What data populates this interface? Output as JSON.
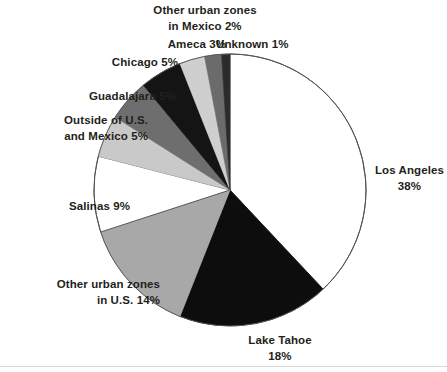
{
  "chart_data": {
    "type": "pie",
    "title": "",
    "subtitle": "",
    "xlabel": "",
    "ylabel": "",
    "legend_position": "none",
    "grid": false,
    "units": "percent",
    "start_angle_deg": 0,
    "direction": "clockwise",
    "categories": [
      "Los Angeles",
      "Lake Tahoe",
      "Other urban zones in U.S.",
      "Salinas",
      "Outside of U.S. and Mexico",
      "Guadalajara",
      "Chicago",
      "Ameca",
      "Other urban zones in Mexico",
      "Unknown"
    ],
    "values": [
      38,
      18,
      14,
      9,
      5,
      5,
      5,
      3,
      2,
      1
    ],
    "colors": [
      "#ffffff",
      "#0d0d0d",
      "#a8a8a8",
      "#ffffff",
      "#c9c9c9",
      "#6e6e6e",
      "#141414",
      "#cfcfcf",
      "#6b6b6b",
      "#2b2b2b"
    ],
    "slices": [
      {
        "name": "Los Angeles",
        "value": 38,
        "color": "#ffffff"
      },
      {
        "name": "Lake Tahoe",
        "value": 18,
        "color": "#0d0d0d"
      },
      {
        "name": "Other urban zones in U.S.",
        "value": 14,
        "color": "#a8a8a8"
      },
      {
        "name": "Salinas",
        "value": 9,
        "color": "#ffffff"
      },
      {
        "name": "Outside of U.S. and Mexico",
        "value": 5,
        "color": "#c9c9c9"
      },
      {
        "name": "Guadalajara",
        "value": 5,
        "color": "#6e6e6e"
      },
      {
        "name": "Chicago",
        "value": 5,
        "color": "#141414"
      },
      {
        "name": "Ameca",
        "value": 3,
        "color": "#cfcfcf"
      },
      {
        "name": "Other urban zones in Mexico",
        "value": 2,
        "color": "#6b6b6b"
      },
      {
        "name": "Unknown",
        "value": 1,
        "color": "#2b2b2b"
      }
    ]
  },
  "labels": {
    "mexico_other_line1": "Other urban zones",
    "mexico_other_line2": "in Mexico 2%",
    "ameca": "Ameca 3%",
    "unknown": "Unknown 1%",
    "chicago": "Chicago 5%",
    "guadalajara": "Guadalajara 5%",
    "outside_line1": "Outside of U.S.",
    "outside_line2": "and Mexico 5%",
    "salinas": "Salinas 9%",
    "us_other_line1": "Other urban zones",
    "us_other_line2": "in U.S. 14%",
    "la_line1": "Los Angeles",
    "la_line2": "38%",
    "tahoe_line1": "Lake Tahoe",
    "tahoe_line2": "18%"
  },
  "style": {
    "outline_color": "#555555",
    "text_color": "#231f20",
    "background": "#ffffff"
  }
}
